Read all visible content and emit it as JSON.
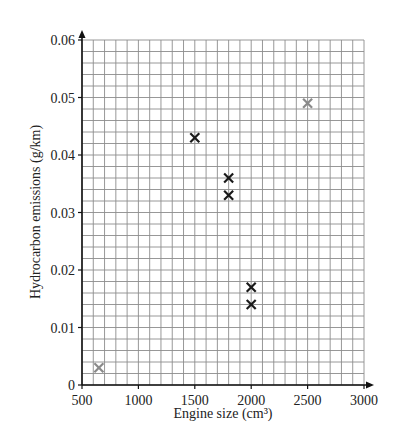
{
  "chart_data": {
    "type": "scatter",
    "title": "",
    "xlabel": "Engine size (cm³)",
    "ylabel": "Hydrocarbon emissions (g/km)",
    "xlim": [
      500,
      3000
    ],
    "ylim": [
      0,
      0.06
    ],
    "x_ticks": [
      500,
      1000,
      1500,
      2000,
      2500,
      3000
    ],
    "x_tick_labels": [
      "500",
      "1000",
      "1500",
      "2000",
      "2500",
      "3000"
    ],
    "y_ticks": [
      0,
      0.01,
      0.02,
      0.03,
      0.04,
      0.05,
      0.06
    ],
    "y_tick_labels": [
      "0",
      "0.01",
      "0.02",
      "0.03",
      "0.04",
      "0.05",
      "0.06"
    ],
    "grid": true,
    "grid_minor_x_step": 100,
    "grid_minor_y_step": 0.002,
    "series": [
      {
        "name": "plotted points",
        "marker": "x",
        "color": "#1a1a1a",
        "points": [
          {
            "x": 1500,
            "y": 0.043
          },
          {
            "x": 1800,
            "y": 0.036
          },
          {
            "x": 1800,
            "y": 0.033
          },
          {
            "x": 2000,
            "y": 0.017
          },
          {
            "x": 2000,
            "y": 0.014
          }
        ]
      },
      {
        "name": "grey points",
        "marker": "x",
        "color": "#8a8a8a",
        "points": [
          {
            "x": 650,
            "y": 0.003
          },
          {
            "x": 2500,
            "y": 0.049
          }
        ]
      }
    ]
  },
  "layout": {
    "plot_left": 82,
    "plot_right": 364,
    "plot_top": 40,
    "plot_bottom": 385
  },
  "colors": {
    "axis": "#111111",
    "grid": "#8c8c8c",
    "text": "#222222"
  }
}
